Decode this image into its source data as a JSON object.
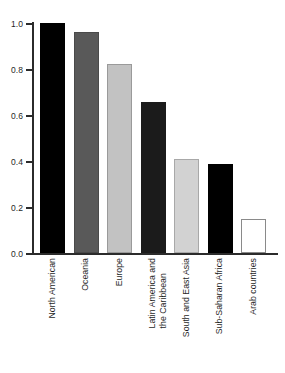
{
  "chart_data": {
    "type": "bar",
    "title": "",
    "subtitle": "",
    "xlabel": "",
    "ylabel": "",
    "ylim": [
      0.0,
      1.0
    ],
    "grid": false,
    "legend": null,
    "y_ticks": [
      "1.0",
      "0.8",
      "0.6",
      "0.4",
      "0.2",
      "0.0"
    ],
    "y_tick_values": [
      1.0,
      0.8,
      0.6,
      0.4,
      0.2,
      0.0
    ],
    "categories": [
      "North American",
      "Oceania",
      "Europe",
      "Latin America and\nthe Caribbean",
      "South and East Asia",
      "Sub-Saharan Africa",
      "Arab countries"
    ],
    "values": [
      1.0,
      0.96,
      0.82,
      0.655,
      0.41,
      0.385,
      0.15
    ],
    "bar_colors": [
      "#000000",
      "#595959",
      "#c2c2c2",
      "#1b1b1b",
      "#d2d2d2",
      "#000000",
      "#ffffff"
    ],
    "bar_edge_colors": [
      "#000000",
      "#4a4a4a",
      "#9a9a9a",
      "#1b1b1b",
      "#a8a8a8",
      "#000000",
      "#8a8a8a"
    ]
  },
  "axis": {
    "y": {
      "ticks": [
        {
          "label": "1.0",
          "value": 1.0
        },
        {
          "label": "0.8",
          "value": 0.8
        },
        {
          "label": "0.6",
          "value": 0.6
        },
        {
          "label": "0.4",
          "value": 0.4
        },
        {
          "label": "0.2",
          "value": 0.2
        },
        {
          "label": "0.0",
          "value": 0.0
        }
      ]
    },
    "x": {
      "labels": [
        "North American",
        "Oceania",
        "Europe",
        "Latin America and\nthe Caribbean",
        "South and East Asia",
        "Sub-Saharan Africa",
        "Arab countries"
      ]
    }
  }
}
